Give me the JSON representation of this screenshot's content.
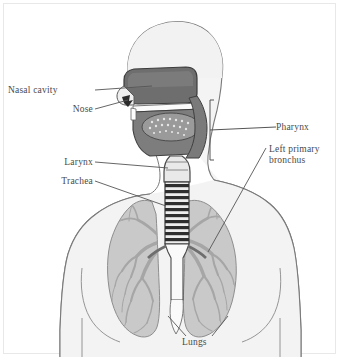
{
  "figure": {
    "type": "anatomical-diagram"
  },
  "labels": {
    "nasal_cavity": "Nasal cavity",
    "nose": "Nose",
    "larynx": "Larynx",
    "trachea": "Trachea",
    "pharynx": "Pharynx",
    "bronchus_line1": "Left primary",
    "bronchus_line2": "bronchus",
    "lungs": "Lungs"
  },
  "colors": {
    "background": "#ffffff",
    "body_fill": "#f1f1f1",
    "body_outline": "#6f6f6f",
    "airway_dark": "#6a6a6a",
    "airway_mid": "#8d8d8d",
    "lung_fill": "#c9c9c9",
    "bronchial_tree": "#a8a8a8",
    "trachea_ring": "#2e2e2e",
    "leader_line": "#555555",
    "label_text": "#4a4a4a",
    "border": "#e3e3e3"
  },
  "parts": [
    {
      "name": "nasal-cavity",
      "label": "Nasal cavity"
    },
    {
      "name": "nose",
      "label": "Nose"
    },
    {
      "name": "pharynx",
      "label": "Pharynx"
    },
    {
      "name": "larynx",
      "label": "Larynx"
    },
    {
      "name": "trachea",
      "label": "Trachea"
    },
    {
      "name": "left-primary-bronchus",
      "label": "Left primary bronchus"
    },
    {
      "name": "lungs",
      "label": "Lungs"
    }
  ]
}
